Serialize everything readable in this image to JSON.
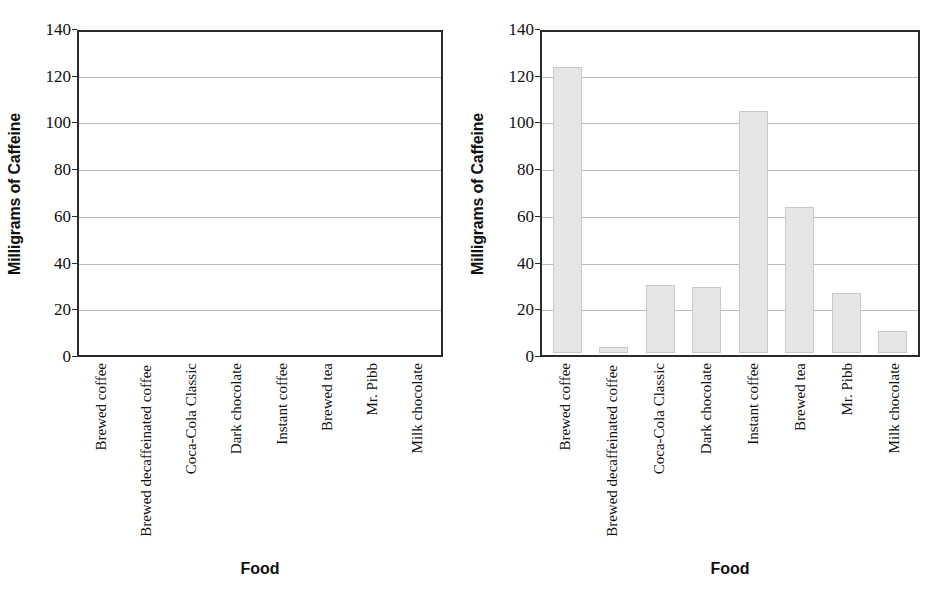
{
  "chart_data": [
    {
      "type": "bar",
      "panel": "left",
      "title": "",
      "xlabel": "Food",
      "ylabel": "Milligrams of Caffeine",
      "ylim": [
        0,
        140
      ],
      "ytick_step": 20,
      "yticks": [
        "140",
        "120",
        "100",
        "80",
        "60",
        "40",
        "20",
        "0"
      ],
      "grid": true,
      "legend": "none",
      "categories": [
        "Brewed coffee",
        "Brewed decaffeinated coffee",
        "Coca-Cola Classic",
        "Dark chocolate",
        "Instant coffee",
        "Brewed tea",
        "Mr. Pibb",
        "Milk chocolate"
      ],
      "values": [
        null,
        null,
        null,
        null,
        null,
        null,
        null,
        null
      ],
      "note": "empty plot - axes only, no bars drawn"
    },
    {
      "type": "bar",
      "panel": "right",
      "title": "",
      "xlabel": "Food",
      "ylabel": "Milligrams of Caffeine",
      "ylim": [
        0,
        140
      ],
      "ytick_step": 20,
      "yticks": [
        "140",
        "120",
        "100",
        "80",
        "60",
        "40",
        "20",
        "0"
      ],
      "grid": true,
      "legend": "none",
      "categories": [
        "Brewed coffee",
        "Brewed decaffeinated coffee",
        "Coca-Cola Classic",
        "Dark chocolate",
        "Instant coffee",
        "Brewed tea",
        "Mr. Pibb",
        "Milk chocolate"
      ],
      "values": [
        124,
        2.5,
        29.5,
        28.5,
        105,
        63.5,
        26,
        9.5
      ]
    }
  ],
  "colors": {
    "bar_fill": "#e6e6e6",
    "bar_stroke": "#c9c9c9",
    "axis": "#2b2b2b",
    "gridline": "#bdbdbd",
    "text": "#111111",
    "background": "#ffffff"
  },
  "panels": {
    "left": {
      "ylabel": "Milligrams of Caffeine",
      "xlabel": "Food",
      "yticks": [
        "140",
        "120",
        "100",
        "80",
        "60",
        "40",
        "20",
        "0"
      ],
      "categories": [
        "Brewed coffee",
        "Brewed decaffeinated coffee",
        "Coca-Cola Classic",
        "Dark chocolate",
        "Instant coffee",
        "Brewed tea",
        "Mr. Pibb",
        "Milk chocolate"
      ]
    },
    "right": {
      "ylabel": "Milligrams of Caffeine",
      "xlabel": "Food",
      "yticks": [
        "140",
        "120",
        "100",
        "80",
        "60",
        "40",
        "20",
        "0"
      ],
      "categories": [
        "Brewed coffee",
        "Brewed decaffeinated coffee",
        "Coca-Cola Classic",
        "Dark chocolate",
        "Instant coffee",
        "Brewed tea",
        "Mr. Pibb",
        "Milk chocolate"
      ]
    }
  }
}
